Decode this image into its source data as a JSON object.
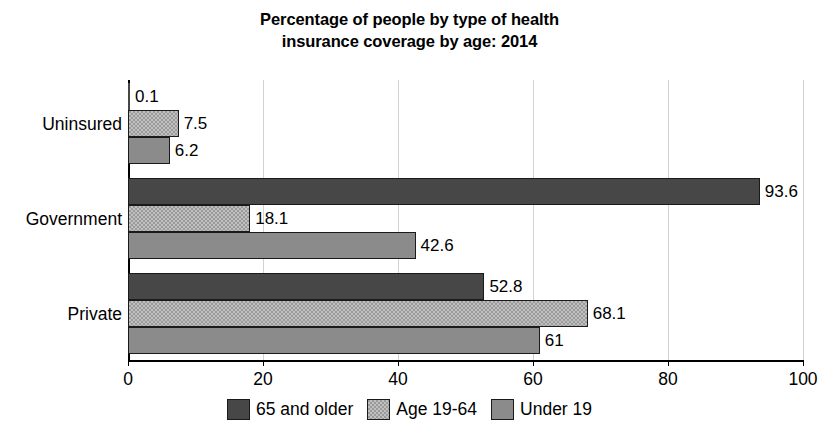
{
  "chart_data": {
    "type": "bar",
    "orientation": "horizontal",
    "title": "Percentage of people by type of health insurance coverage by age: 2014",
    "title_lines": [
      "Percentage of people by type of health",
      "insurance coverage by age: 2014"
    ],
    "xlabel": "",
    "ylabel": "",
    "categories": [
      "Uninsured",
      "Government",
      "Private"
    ],
    "xticks": [
      "0",
      "20",
      "40",
      "60",
      "80",
      "100"
    ],
    "xlim": [
      0,
      100
    ],
    "grid": "vertical",
    "legend_position": "bottom",
    "series": [
      {
        "name": "65 and older",
        "color": "#474747",
        "values": [
          0.1,
          93.6,
          52.8
        ],
        "labels": [
          "0.1",
          "93.6",
          "52.8"
        ]
      },
      {
        "name": "Age 19-64",
        "color": "#9a9a9a",
        "values": [
          7.5,
          18.1,
          68.1
        ],
        "labels": [
          "7.5",
          "18.1",
          "68.1"
        ]
      },
      {
        "name": "Under 19",
        "color": "#8b8b8b",
        "values": [
          6.2,
          42.6,
          61
        ],
        "labels": [
          "6.2",
          "42.6",
          "61"
        ]
      }
    ]
  }
}
